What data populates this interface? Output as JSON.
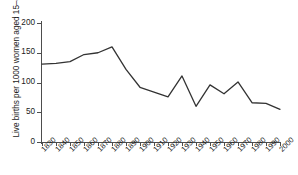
{
  "chart_data": {
    "type": "line",
    "title": "",
    "xlabel": "",
    "ylabel": "Live births per 1000 women aged 15–44",
    "x": [
      1830,
      1840,
      1850,
      1860,
      1870,
      1880,
      1890,
      1900,
      1910,
      1920,
      1930,
      1940,
      1950,
      1960,
      1970,
      1980,
      1990,
      2000
    ],
    "values": [
      131,
      132,
      135,
      147,
      150,
      160,
      122,
      92,
      84,
      76,
      111,
      60,
      96,
      81,
      101,
      66,
      65,
      55
    ],
    "categories": [
      "1830",
      "1840",
      "1850",
      "1860",
      "1870",
      "1880",
      "1890",
      "1900",
      "1910",
      "1920",
      "1930",
      "1940",
      "1950",
      "1960",
      "1970",
      "1980",
      "1990",
      "2000"
    ],
    "xlim": [
      1830,
      2000
    ],
    "ylim": [
      0,
      200
    ],
    "yticks": [
      0,
      50,
      100,
      150,
      200
    ],
    "ytick_labels": [
      "0",
      "50",
      "100",
      "150",
      "200"
    ],
    "xtick_labels": [
      "1830",
      "1840",
      "1850",
      "1860",
      "1870",
      "1880",
      "1890",
      "1900",
      "1910",
      "1920",
      "1930",
      "1940",
      "1950",
      "1960",
      "1970",
      "1980",
      "1990",
      "2000"
    ],
    "grid": false,
    "legend": null,
    "series_color": "#333333",
    "axis_color": "#4d4d4d"
  }
}
